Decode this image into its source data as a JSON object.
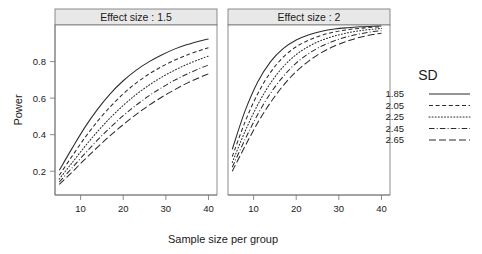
{
  "chart_data": {
    "type": "line",
    "title": "",
    "xlabel": "Sample size per group",
    "ylabel": "Power",
    "xlim": [
      4,
      42
    ],
    "ylim": [
      0.07,
      1.0
    ],
    "grid": false,
    "legend_position": "right",
    "legend_title": "SD",
    "facet_variable": "Effect size",
    "x_ticks": [
      10,
      20,
      30,
      40
    ],
    "x_tick_labels": [
      "10",
      "20",
      "30",
      "40"
    ],
    "y_ticks": [
      0.2,
      0.4,
      0.6,
      0.8
    ],
    "y_tick_labels": [
      "0.2",
      "0.4",
      "0.6",
      "0.8"
    ],
    "panels": [
      {
        "strip_label": "Effect size : 1.5",
        "effect_size": 1.5,
        "x": [
          5,
          8,
          11,
          14,
          17,
          20,
          23,
          26,
          29,
          32,
          35,
          38,
          40
        ],
        "series": [
          {
            "name": "1.85",
            "sd": 1.85,
            "linestyle": "solid",
            "dasharray": "none",
            "values": [
              0.205,
              0.325,
              0.44,
              0.54,
              0.625,
              0.695,
              0.752,
              0.798,
              0.836,
              0.868,
              0.893,
              0.913,
              0.924
            ]
          },
          {
            "name": "2.05",
            "sd": 2.05,
            "linestyle": "dashed",
            "dasharray": "4,2.6",
            "values": [
              0.178,
              0.282,
              0.383,
              0.474,
              0.554,
              0.623,
              0.682,
              0.731,
              0.772,
              0.807,
              0.836,
              0.861,
              0.875
            ]
          },
          {
            "name": "2.25",
            "sd": 2.25,
            "linestyle": "dotted",
            "dasharray": "1,2.1",
            "values": [
              0.157,
              0.246,
              0.335,
              0.418,
              0.493,
              0.56,
              0.619,
              0.67,
              0.714,
              0.752,
              0.785,
              0.813,
              0.83
            ]
          },
          {
            "name": "2.45",
            "sd": 2.45,
            "linestyle": "dash-dot",
            "dasharray": "5.5,2.2,1,2.2",
            "values": [
              0.141,
              0.218,
              0.296,
              0.371,
              0.44,
              0.504,
              0.561,
              0.612,
              0.657,
              0.697,
              0.732,
              0.763,
              0.781
            ]
          },
          {
            "name": "2.65",
            "sd": 2.65,
            "linestyle": "longdash",
            "dasharray": "7,3",
            "values": [
              0.128,
              0.195,
              0.265,
              0.332,
              0.396,
              0.455,
              0.51,
              0.56,
              0.605,
              0.645,
              0.682,
              0.714,
              0.733
            ]
          }
        ]
      },
      {
        "strip_label": "Effect size : 2",
        "effect_size": 2,
        "x": [
          5,
          8,
          11,
          14,
          17,
          20,
          23,
          26,
          29,
          32,
          35,
          38,
          40
        ],
        "series": [
          {
            "name": "1.85",
            "sd": 1.85,
            "linestyle": "solid",
            "dasharray": "none",
            "values": [
              0.32,
              0.53,
              0.69,
              0.8,
              0.872,
              0.918,
              0.947,
              0.966,
              0.978,
              0.985,
              0.99,
              0.993,
              0.995
            ]
          },
          {
            "name": "2.05",
            "sd": 2.05,
            "linestyle": "dashed",
            "dasharray": "4,2.6",
            "values": [
              0.28,
              0.47,
              0.625,
              0.742,
              0.825,
              0.881,
              0.918,
              0.944,
              0.962,
              0.974,
              0.982,
              0.988,
              0.99
            ]
          },
          {
            "name": "2.25",
            "sd": 2.25,
            "linestyle": "dotted",
            "dasharray": "1,2.1",
            "values": [
              0.248,
              0.418,
              0.565,
              0.683,
              0.773,
              0.838,
              0.884,
              0.917,
              0.94,
              0.957,
              0.969,
              0.977,
              0.981
            ]
          },
          {
            "name": "2.45",
            "sd": 2.45,
            "linestyle": "dash-dot",
            "dasharray": "5.5,2.2,1,2.2",
            "values": [
              0.222,
              0.374,
              0.512,
              0.628,
              0.72,
              0.792,
              0.845,
              0.885,
              0.914,
              0.936,
              0.952,
              0.964,
              0.969
            ]
          },
          {
            "name": "2.65",
            "sd": 2.65,
            "linestyle": "longdash",
            "dasharray": "7,3",
            "values": [
              0.2,
              0.337,
              0.466,
              0.577,
              0.67,
              0.745,
              0.804,
              0.85,
              0.885,
              0.912,
              0.933,
              0.948,
              0.955
            ]
          }
        ]
      }
    ],
    "legend_entries": [
      {
        "label": "1.85",
        "linestyle": "solid",
        "dasharray": "none"
      },
      {
        "label": "2.05",
        "linestyle": "dashed",
        "dasharray": "4,2.6"
      },
      {
        "label": "2.25",
        "linestyle": "dotted",
        "dasharray": "1,2.1"
      },
      {
        "label": "2.45",
        "linestyle": "dash-dot",
        "dasharray": "5.5,2.2,1,2.2"
      },
      {
        "label": "2.65",
        "linestyle": "longdash",
        "dasharray": "7,3"
      }
    ],
    "colors": {
      "line": "#2b2b2b",
      "strip_fill": "#e8e8e8",
      "frame": "#707070",
      "text": "#1a1a1a",
      "background": "#ffffff"
    }
  }
}
